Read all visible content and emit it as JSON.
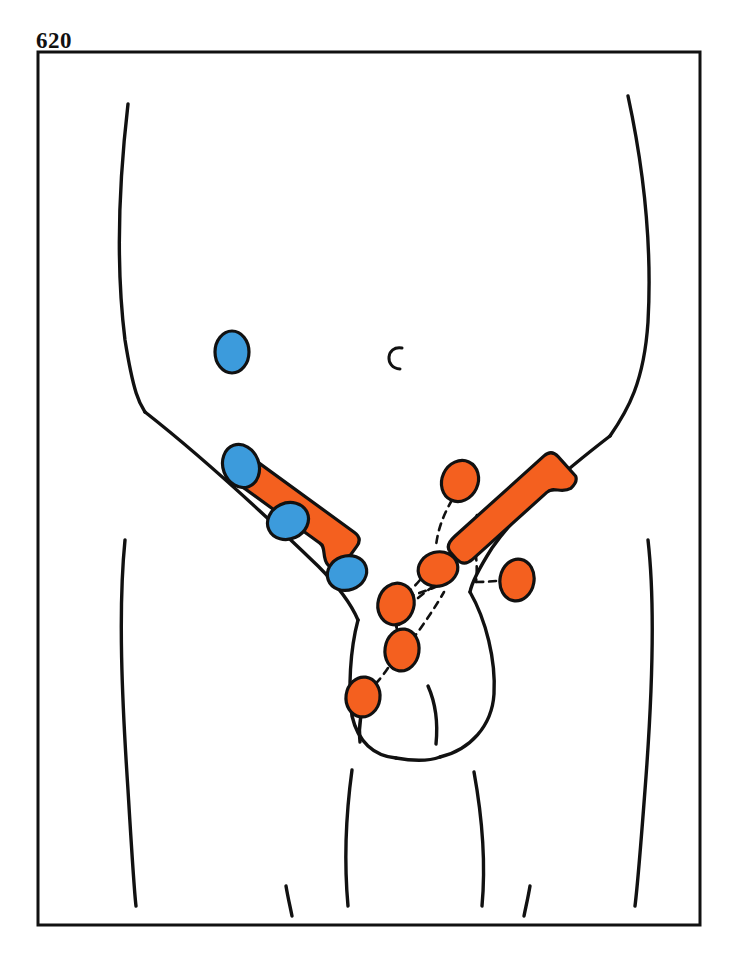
{
  "page": {
    "number": "620",
    "background_color": "#ffffff",
    "ink_color": "#111111"
  },
  "figure": {
    "frame": {
      "x": 38,
      "y": 52,
      "width": 662,
      "height": 873,
      "stroke": "#111111",
      "stroke_width": 3
    },
    "palette": {
      "orange": "#F4601F",
      "orange_dark": "#E8551A",
      "blue": "#3C9BDC",
      "blue_dark": "#2E86C4",
      "outline": "#111111",
      "paper": "#ffffff"
    },
    "body_outline": {
      "stroke": "#111111",
      "stroke_width": 3.4,
      "paths": {
        "flank_left": "M128,104 C118,190 116,268 125,340 C134,396 140,404 145,412",
        "flank_right": "M628,96 C644,170 652,250 648,322 C644,382 628,410 610,436",
        "inguinal_fold_left": "M145,412 C196,452 262,512 318,566 C340,588 352,606 358,620",
        "inguinal_fold_right": "M610,436 C566,470 520,508 492,548 C478,570 472,582 470,592",
        "hip_left": "M125,540 C118,610 122,700 128,790 C132,856 134,890 136,906",
        "hip_right": "M648,540 C656,610 652,700 645,790 C640,856 637,890 635,906",
        "groin_left": "M358,620 C350,650 348,690 352,716 C358,742 374,756 396,758",
        "groin_right": "M470,592 C486,620 496,660 494,694 C492,726 470,750 440,757",
        "scrotum": "M396,758 C418,762 432,760 440,757",
        "penis_left": "M368,690 C362,706 358,724 360,742",
        "penis_right": "M428,686 C436,704 438,724 436,744",
        "thigh_inner_left": "M352,770 C346,814 344,862 348,906",
        "thigh_inner_right": "M474,772 C482,816 486,862 482,906",
        "leg_crease_left": "M286,886 C288,898 290,906 292,916",
        "leg_crease_right": "M530,886 C528,898 526,906 524,916"
      }
    },
    "navel": {
      "x": 395,
      "y": 358,
      "label": "umbilicus",
      "glyph": "C"
    },
    "lymph_bars": [
      {
        "id": "inguinal-ligament-left",
        "cx": 292,
        "cy": 513,
        "length": 132,
        "thickness": 42,
        "rotation": 36,
        "color": "#F4601F"
      },
      {
        "id": "inguinal-ligament-right",
        "cx": 512,
        "cy": 513,
        "length": 132,
        "thickness": 42,
        "rotation": -42,
        "color": "#F4601F"
      }
    ],
    "blue_nodes": [
      {
        "id": "blue-node-1",
        "cx": 232,
        "cy": 352,
        "rx": 17,
        "ry": 21,
        "rotation": 0
      },
      {
        "id": "blue-node-2",
        "cx": 241,
        "cy": 466,
        "rx": 18,
        "ry": 22,
        "rotation": -20
      },
      {
        "id": "blue-node-3",
        "cx": 288,
        "cy": 521,
        "rx": 21,
        "ry": 18,
        "rotation": -25
      },
      {
        "id": "blue-node-4",
        "cx": 347,
        "cy": 573,
        "rx": 20,
        "ry": 17,
        "rotation": -20
      }
    ],
    "orange_nodes": [
      {
        "id": "orange-node-1",
        "cx": 460,
        "cy": 481,
        "rx": 18,
        "ry": 21,
        "rotation": 25
      },
      {
        "id": "orange-node-2",
        "cx": 438,
        "cy": 569,
        "rx": 20,
        "ry": 17,
        "rotation": -15
      },
      {
        "id": "orange-node-3",
        "cx": 517,
        "cy": 580,
        "rx": 17,
        "ry": 21,
        "rotation": 10
      },
      {
        "id": "orange-node-4",
        "cx": 396,
        "cy": 604,
        "rx": 18,
        "ry": 21,
        "rotation": 15
      },
      {
        "id": "orange-node-5",
        "cx": 402,
        "cy": 650,
        "rx": 17,
        "ry": 21,
        "rotation": 8
      },
      {
        "id": "orange-node-6",
        "cx": 363,
        "cy": 697,
        "rx": 17,
        "ry": 20,
        "rotation": 8
      }
    ],
    "lymph_vessels": {
      "stroke": "#111111",
      "stroke_width": 2.6,
      "dash": "7 6",
      "paths": [
        "M452,500 C444,514 438,528 436,546",
        "M438,586 C424,592 410,596 398,600",
        "M456,556 C468,538 474,524 478,512",
        "M470,528 C476,548 478,566 476,582",
        "M476,582 C492,582 504,580 500,580",
        "M420,580 C410,592 404,594 398,600",
        "M396,624 C398,636 400,642 402,632",
        "M398,620 C394,636 396,644 400,648",
        "M388,668 C380,680 372,688 366,692",
        "M418,598 C432,586 444,580 452,576",
        "M412,640 C424,624 436,606 444,592"
      ]
    }
  }
}
